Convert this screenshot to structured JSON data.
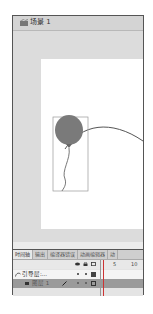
{
  "scene_tab": {
    "label": "场景 1",
    "icon": "scene-icon"
  },
  "stage": {
    "background": "#ffffff",
    "pasteboard": "#dcdcdc",
    "objects": [
      {
        "type": "balloon",
        "fill": "#7a7a7a",
        "selected": true
      },
      {
        "type": "motion-guide-path",
        "stroke": "#555555"
      }
    ]
  },
  "timeline": {
    "tabs": [
      {
        "label": "时间轴",
        "active": true
      },
      {
        "label": "输出",
        "active": false
      },
      {
        "label": "编译器错误",
        "active": false
      },
      {
        "label": "动画编辑器",
        "active": false
      },
      {
        "label": "动",
        "active": false
      }
    ],
    "header_icons": [
      "eye-icon",
      "lock-icon",
      "outline-icon"
    ],
    "frame_numbers": [
      "5",
      "10"
    ],
    "layers": [
      {
        "name": "引导层:...",
        "type": "guide",
        "icon": "guide-layer-icon"
      },
      {
        "name": "图层 1",
        "type": "normal",
        "icon": "layer-icon"
      }
    ]
  }
}
